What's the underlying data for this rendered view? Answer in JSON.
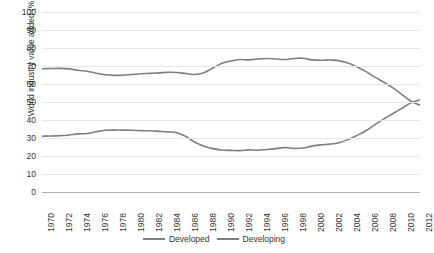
{
  "chart_data": {
    "type": "line",
    "title": "",
    "xlabel": "",
    "ylabel": "World industry value added (%)",
    "xlim": [
      1970,
      2012
    ],
    "ylim": [
      0,
      100
    ],
    "grid": true,
    "legend_position": "bottom",
    "yticks": [
      100,
      90,
      80,
      70,
      60,
      50,
      40,
      30,
      20,
      10,
      0
    ],
    "xticks": [
      1970,
      1972,
      1974,
      1976,
      1978,
      1980,
      1982,
      1984,
      1986,
      1988,
      1990,
      1992,
      1994,
      1996,
      1998,
      2000,
      2002,
      2004,
      2006,
      2008,
      2010,
      2012
    ],
    "x": [
      1970,
      1971,
      1972,
      1973,
      1974,
      1975,
      1976,
      1977,
      1978,
      1979,
      1980,
      1981,
      1982,
      1983,
      1984,
      1985,
      1986,
      1987,
      1988,
      1989,
      1990,
      1991,
      1992,
      1993,
      1994,
      1995,
      1996,
      1997,
      1998,
      1999,
      2000,
      2001,
      2002,
      2003,
      2004,
      2005,
      2006,
      2007,
      2008,
      2009,
      2010,
      2011,
      2012
    ],
    "series": [
      {
        "name": "Developed",
        "color": "#7f7f7f",
        "values": [
          68.5,
          68.6,
          68.7,
          68.4,
          67.6,
          67.1,
          66.0,
          65.1,
          64.8,
          64.9,
          65.3,
          65.7,
          65.9,
          66.2,
          66.5,
          66.4,
          65.8,
          65.3,
          66.3,
          68.9,
          71.5,
          72.8,
          73.6,
          73.4,
          73.9,
          74.2,
          73.9,
          73.6,
          74.2,
          74.3,
          73.4,
          73.2,
          73.3,
          73.0,
          71.6,
          69.4,
          66.9,
          63.8,
          60.9,
          57.8,
          54.1,
          50.4,
          48.2
        ]
      },
      {
        "name": "Developing",
        "color": "#7f7f7f",
        "values": [
          31.0,
          31.1,
          31.3,
          31.7,
          32.3,
          32.5,
          33.5,
          34.3,
          34.4,
          34.4,
          34.3,
          34.1,
          34.0,
          33.7,
          33.4,
          32.9,
          30.8,
          27.6,
          25.4,
          24.1,
          23.3,
          23.1,
          23.0,
          23.4,
          23.2,
          23.6,
          24.1,
          24.7,
          24.2,
          24.4,
          25.5,
          26.2,
          26.6,
          27.4,
          29.1,
          31.4,
          34.0,
          37.4,
          40.6,
          43.6,
          46.5,
          49.5,
          51.3
        ]
      }
    ]
  },
  "legend": {
    "items": [
      {
        "label": "Developed"
      },
      {
        "label": "Developing"
      }
    ]
  },
  "axes": {
    "ylabel": "World industry value added (%)"
  }
}
